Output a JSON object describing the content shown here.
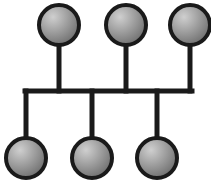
{
  "diagram": {
    "type": "bus-topology",
    "colors": {
      "line": "#1a1a1a",
      "node_stroke": "#1a1a1a",
      "node_fill_light": "#cfcfcf",
      "node_fill_dark": "#6e6e6e",
      "background": "#ffffff"
    },
    "bus": {
      "x1": 25,
      "x2": 192,
      "y": 91,
      "stroke_width": 5
    },
    "node_radius": 20,
    "node_stroke_width": 4,
    "top_nodes": [
      {
        "cx": 59,
        "cy": 25
      },
      {
        "cx": 126,
        "cy": 25
      },
      {
        "cx": 190,
        "cy": 25
      }
    ],
    "bottom_nodes": [
      {
        "cx": 26,
        "cy": 158
      },
      {
        "cx": 92,
        "cy": 158
      },
      {
        "cx": 157,
        "cy": 158
      }
    ]
  }
}
